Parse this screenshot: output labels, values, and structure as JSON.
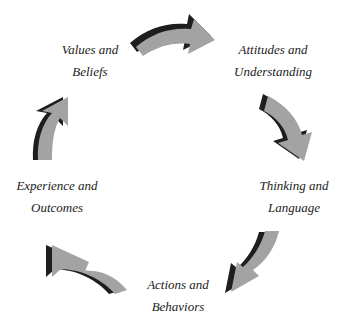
{
  "diagram": {
    "type": "cycle",
    "colors": {
      "arrow_face": "#a3a3a3",
      "arrow_shadow": "#1e1e1e",
      "text": "#222222",
      "background": "#ffffff"
    },
    "nodes": [
      {
        "id": "values",
        "line1": "Values and",
        "line2": "Beliefs"
      },
      {
        "id": "attitudes",
        "line1": "Attitudes and",
        "line2": "Understanding"
      },
      {
        "id": "thinking",
        "line1": "Thinking and",
        "line2": "Language"
      },
      {
        "id": "actions",
        "line1": "Actions and",
        "line2": "Behaviors"
      },
      {
        "id": "experience",
        "line1": "Experience and",
        "line2": "Outcomes"
      }
    ],
    "arrows": [
      {
        "from": "values",
        "to": "attitudes",
        "icon": "curved-arrow-right-icon"
      },
      {
        "from": "attitudes",
        "to": "thinking",
        "icon": "curved-arrow-down-icon"
      },
      {
        "from": "thinking",
        "to": "actions",
        "icon": "curved-arrow-down-left-icon"
      },
      {
        "from": "actions",
        "to": "experience",
        "icon": "curved-arrow-up-left-icon"
      },
      {
        "from": "experience",
        "to": "values",
        "icon": "curved-arrow-up-icon"
      }
    ]
  }
}
